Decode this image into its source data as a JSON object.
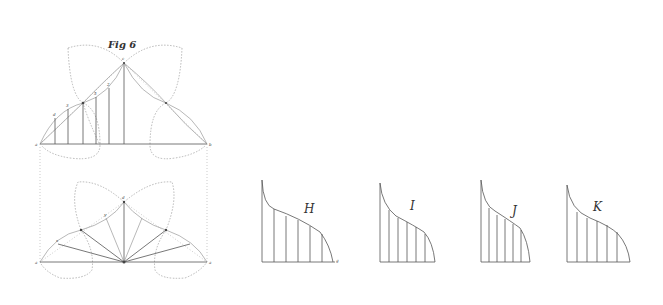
{
  "figure": {
    "title": "Fig 6",
    "top_points": {
      "left": "a",
      "right": "b",
      "apex": "c",
      "ordinate_labels": [
        "a",
        "1",
        "4",
        "d",
        "g",
        "c"
      ],
      "curve_labels": [
        "d",
        "3",
        "4",
        "5",
        "2",
        "y"
      ]
    },
    "bottom_points": {
      "left": "a",
      "right": "a",
      "apex": "d",
      "mid_left": "x",
      "mid_upper": "y"
    }
  },
  "subfigures": [
    {
      "id": "H",
      "label": "H",
      "base_labels": [
        "i",
        "a",
        "b",
        "m",
        "n",
        "o",
        "p"
      ],
      "end_label": "g"
    },
    {
      "id": "I",
      "label": "I",
      "base_labels": [
        "i",
        "a"
      ]
    },
    {
      "id": "J",
      "label": "J",
      "base_labels": [
        "i",
        "b"
      ]
    },
    {
      "id": "K",
      "label": "K",
      "base_labels": [
        "i",
        "e"
      ]
    }
  ]
}
